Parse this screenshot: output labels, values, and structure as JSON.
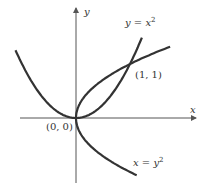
{
  "axes": {
    "x_label": "x",
    "y_label": "y"
  },
  "curves": [
    {
      "name": "parabola-y-eq-x2",
      "label_lhs": "y",
      "label_eq": " = ",
      "label_rhs": "x",
      "label_exp": "2"
    },
    {
      "name": "parabola-x-eq-y2",
      "label_lhs": "x",
      "label_eq": " = ",
      "label_rhs": "y",
      "label_exp": "2"
    }
  ],
  "points": [
    {
      "label": "(0, 0)"
    },
    {
      "label": "(1, 1)"
    }
  ],
  "colors": {
    "curve": "#333333",
    "axis": "#555555"
  }
}
